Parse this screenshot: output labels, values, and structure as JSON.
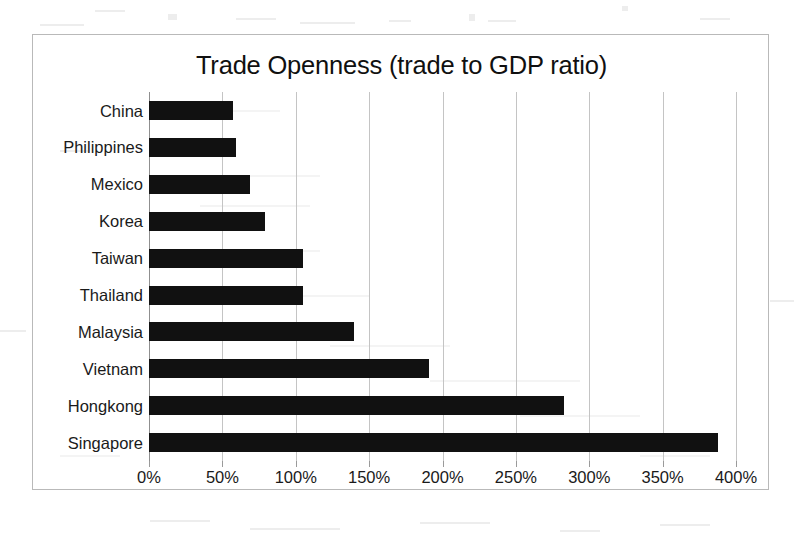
{
  "chart_data": {
    "type": "bar",
    "orientation": "horizontal",
    "title": "Trade Openness (trade to GDP ratio)",
    "xlabel": "",
    "ylabel": "",
    "categories": [
      "China",
      "Philippines",
      "Mexico",
      "Korea",
      "Taiwan",
      "Thailand",
      "Malaysia",
      "Vietnam",
      "Hongkong",
      "Singapore"
    ],
    "values": [
      57,
      59,
      69,
      79,
      105,
      105,
      140,
      191,
      283,
      388
    ],
    "value_unit": "%",
    "xlim": [
      0,
      400
    ],
    "xticks": [
      0,
      50,
      100,
      150,
      200,
      250,
      300,
      350,
      400
    ],
    "xtick_labels": [
      "0%",
      "50%",
      "100%",
      "150%",
      "200%",
      "250%",
      "300%",
      "350%",
      "400%"
    ],
    "grid": "vertical",
    "legend": "none",
    "bar_color": "#111111",
    "gridline_color": "#c4c4c4",
    "frame_color": "#b9b9b9"
  }
}
